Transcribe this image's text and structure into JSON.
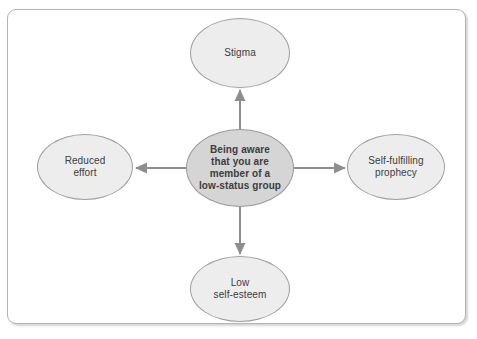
{
  "diagram": {
    "type": "concept-map-radial",
    "frame": {
      "border_color": "#b4b4b4",
      "background_color": "#ffffff"
    },
    "palette": {
      "center_fill": "#d5d5d5",
      "satellite_fill": "#ededed",
      "node_stroke": "#9e9e9e",
      "text_color": "#3c3c3c",
      "arrow_color": "#8e8e8e"
    },
    "center_node": {
      "id": "center",
      "label": "Being aware\nthat you are\nmember of a\nlow-status group",
      "cx": 240,
      "cy": 168,
      "rx": 54,
      "ry": 39,
      "bold": true
    },
    "satellite_nodes": [
      {
        "id": "stigma",
        "label": "Stigma",
        "position": "top",
        "cx": 240,
        "cy": 53,
        "rx": 50,
        "ry": 35
      },
      {
        "id": "reduced-effort",
        "label": "Reduced\neffort",
        "position": "left",
        "cx": 85,
        "cy": 167,
        "rx": 48,
        "ry": 33
      },
      {
        "id": "self-fulfilling-prophecy",
        "label": "Self-fulfilling\nprophecy",
        "position": "right",
        "cx": 396,
        "cy": 167,
        "rx": 49,
        "ry": 33
      },
      {
        "id": "low-self-esteem",
        "label": "Low\nself-esteem",
        "position": "bottom",
        "cx": 240,
        "cy": 289,
        "rx": 50,
        "ry": 33
      }
    ],
    "arrows": [
      {
        "id": "arrow-up",
        "from": "center",
        "to": "stigma",
        "direction": "up"
      },
      {
        "id": "arrow-left",
        "from": "center",
        "to": "reduced-effort",
        "direction": "left"
      },
      {
        "id": "arrow-right",
        "from": "center",
        "to": "self-fulfilling-prophecy",
        "direction": "right"
      },
      {
        "id": "arrow-down",
        "from": "center",
        "to": "low-self-esteem",
        "direction": "down"
      }
    ]
  }
}
